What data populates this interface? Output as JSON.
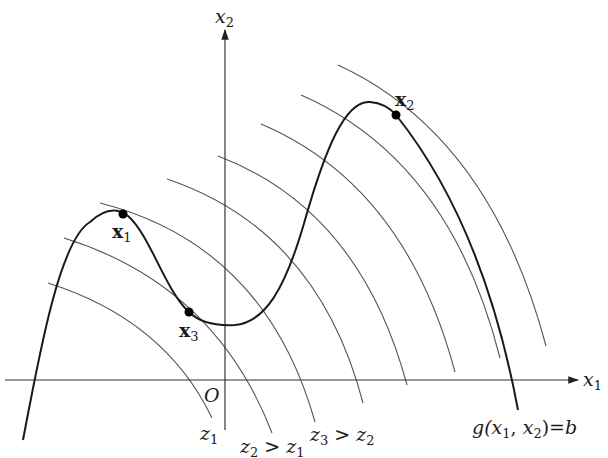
{
  "diagram": {
    "type": "constrained-optimization-contour-plot",
    "axes": {
      "x_label": "x",
      "x_label_sub": "1",
      "y_label": "x",
      "y_label_sub": "2",
      "origin_label": "O"
    },
    "points": [
      {
        "id": "x1",
        "label": "x",
        "sub": "1",
        "cx": 123,
        "cy": 214
      },
      {
        "id": "x2",
        "label": "x",
        "sub": "2",
        "cx": 396,
        "cy": 115
      },
      {
        "id": "x3",
        "label": "x",
        "sub": "3",
        "cx": 189,
        "cy": 312
      }
    ],
    "contour_labels": [
      {
        "id": "z1",
        "text": "z",
        "sub": "1",
        "rel": ""
      },
      {
        "id": "z2",
        "text": "z",
        "sub": "2",
        "rel": ">",
        "rhs": "z",
        "rhs_sub": "1"
      },
      {
        "id": "z3",
        "text": "z",
        "sub": "3",
        "rel": ">",
        "rhs": "z",
        "rhs_sub": "2"
      }
    ],
    "constraint_label": {
      "lhs": "g(",
      "a": "x",
      "a_sub": "1",
      "sep": ", ",
      "b": "x",
      "b_sub": "2",
      "close": ")",
      "eq": "=",
      "rhs": "b"
    },
    "colors": {
      "constraint": "#1a1a1a",
      "contour": "#555555",
      "axis": "#333333",
      "point": "#000000",
      "background": "#ffffff"
    }
  }
}
